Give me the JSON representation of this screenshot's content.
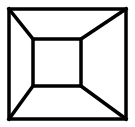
{
  "diagram": {
    "type": "truncated-pyramid-line-drawing",
    "stroke_color": "#000000",
    "background_color": "#ffffff",
    "outer_square": {
      "x1": 9,
      "y1": 9,
      "x2": 126,
      "y2": 119
    },
    "inner_square": {
      "x1": 33,
      "y1": 39,
      "x2": 81,
      "y2": 86
    },
    "connectors": [
      {
        "from": [
          9,
          9
        ],
        "to": [
          33,
          39
        ]
      },
      {
        "from": [
          126,
          9
        ],
        "to": [
          81,
          39
        ]
      },
      {
        "from": [
          9,
          119
        ],
        "to": [
          33,
          86
        ]
      },
      {
        "from": [
          126,
          119
        ],
        "to": [
          81,
          86
        ]
      }
    ]
  }
}
